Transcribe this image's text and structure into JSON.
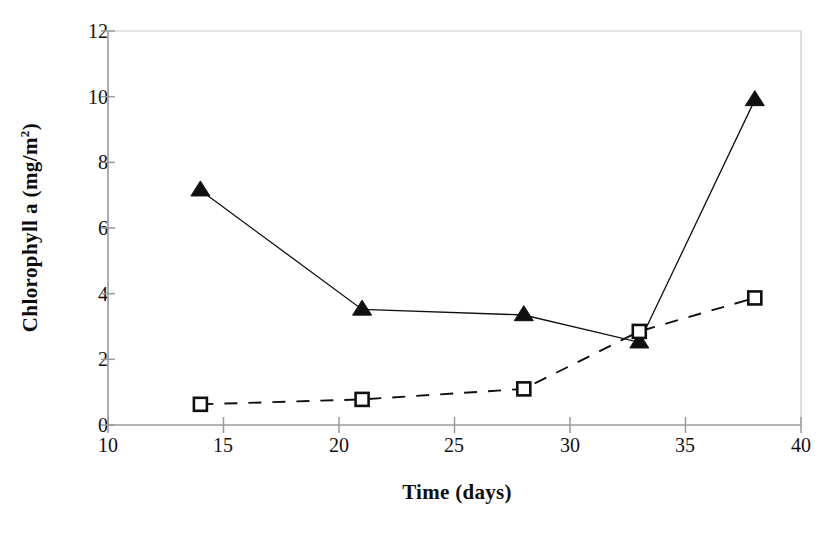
{
  "chart_data": {
    "type": "line",
    "title": "",
    "xlabel": "Time (days)",
    "ylabel": "Chlorophyll a (mg/m2)",
    "ylabel_text": "Chlorophyll a (mg/m",
    "ylabel_sup": "2",
    "ylabel_tail": ")",
    "xlim": [
      10,
      40
    ],
    "ylim": [
      0,
      12
    ],
    "xticks": [
      10,
      15,
      20,
      25,
      30,
      35,
      40
    ],
    "yticks": [
      0,
      2,
      4,
      6,
      8,
      10,
      12
    ],
    "xtick_labels": [
      "10",
      "15",
      "20",
      "25",
      "30",
      "35",
      "40"
    ],
    "ytick_labels": [
      "0",
      "2",
      "4",
      "6",
      "8",
      "10",
      "12"
    ],
    "grid": false,
    "legend": "none",
    "x": [
      14,
      21,
      28,
      33,
      38
    ],
    "series": [
      {
        "name": "filled-triangle-series",
        "marker": "triangle-filled",
        "linestyle": "solid",
        "color": "#101010",
        "x": [
          14,
          21,
          28,
          33,
          38
        ],
        "values": [
          7.15,
          3.52,
          3.35,
          2.52,
          9.9
        ]
      },
      {
        "name": "open-square-series",
        "marker": "square-open",
        "linestyle": "dashed",
        "color": "#101010",
        "x": [
          14,
          21,
          28,
          33,
          38
        ],
        "values": [
          0.63,
          0.78,
          1.1,
          2.85,
          3.87
        ]
      }
    ]
  },
  "axis": {
    "x_title": "Time (days)",
    "y_title_main": "Chlorophyll a (mg/m",
    "y_title_sup": "2",
    "y_title_end": ")"
  },
  "colors": {
    "ink": "#101010",
    "axis": "#9a9a9a",
    "background": "#ffffff"
  },
  "caption": {
    "cut_off_text": ""
  }
}
